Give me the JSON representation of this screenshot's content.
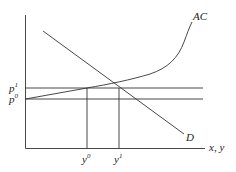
{
  "diagram": {
    "type": "economics-cost-demand",
    "axes": {
      "x_label": "x, y",
      "y_label": ""
    },
    "curves": [
      {
        "name": "AC",
        "label": "AC"
      },
      {
        "name": "D",
        "label": "D"
      }
    ],
    "price_levels": [
      {
        "label": "p",
        "sup": "1"
      },
      {
        "label": "p",
        "sup": "0"
      }
    ],
    "quantity_levels": [
      {
        "label": "y",
        "sup": "0"
      },
      {
        "label": "y",
        "sup": "1"
      }
    ],
    "colors": {
      "line": "#333333",
      "background": "#ffffff"
    }
  }
}
